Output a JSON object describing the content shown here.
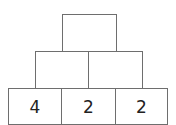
{
  "pyramid": {
    "rows": [
      {
        "cells": [
          ""
        ]
      },
      {
        "cells": [
          "",
          ""
        ]
      },
      {
        "cells": [
          "4",
          "2",
          "2"
        ]
      }
    ]
  }
}
